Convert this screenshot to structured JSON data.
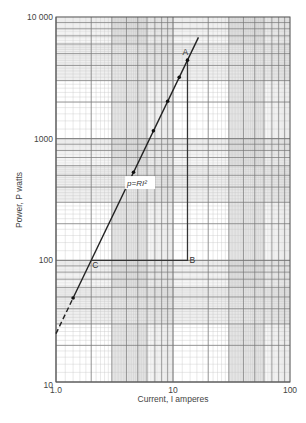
{
  "chart_data": {
    "type": "line",
    "title": "",
    "xlabel": "Current, I amperes",
    "ylabel": "Power, P watts",
    "xscale": "log",
    "yscale": "log",
    "xlim": [
      1,
      100
    ],
    "ylim": [
      10,
      10000
    ],
    "x_tick_labels": [
      "1.0",
      "10",
      "100"
    ],
    "y_tick_labels": [
      "10",
      "100",
      "1000",
      "10 000"
    ],
    "grid": true,
    "series": [
      {
        "name": "p = RI²",
        "x": [
          1.4,
          4.6,
          6.8,
          9.0,
          11.3,
          13.3
        ],
        "y": [
          49,
          530,
          1160,
          2030,
          3190,
          4420
        ]
      }
    ],
    "line_fit": {
      "equation": "p = RI²",
      "R": 25,
      "x_range": [
        1.0,
        16.5
      ],
      "dashed_below": 1.4
    },
    "annotations": [
      {
        "label": "A",
        "x": 13.3,
        "y": 4420
      },
      {
        "label": "B",
        "x": 13.3,
        "y": 100
      },
      {
        "label": "C",
        "x": 2.0,
        "y": 100
      },
      {
        "label": "p=RI²",
        "x": 6.5,
        "y": 400
      }
    ]
  },
  "labels": {
    "xlabel": "Current, I amperes",
    "ylabel": "Power, P watts",
    "equation": "p=RI²",
    "point_a": "A",
    "point_b": "B",
    "point_c": "C"
  }
}
